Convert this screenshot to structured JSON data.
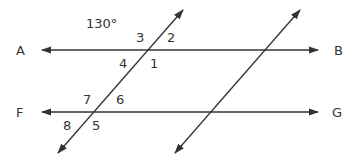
{
  "diagram": {
    "type": "parallel-lines-transversals",
    "angle_label": "130°",
    "points": {
      "A": "A",
      "B": "B",
      "F": "F",
      "G": "G"
    },
    "angles": [
      "1",
      "2",
      "3",
      "4",
      "5",
      "6",
      "7",
      "8"
    ],
    "line_color": "#333333"
  }
}
